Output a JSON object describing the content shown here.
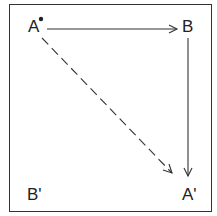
{
  "diagram": {
    "nodes": {
      "a": {
        "label": "A",
        "marker": "dot"
      },
      "b": {
        "label": "B"
      },
      "b_prime": {
        "label": "B'"
      },
      "a_prime": {
        "label": "A'"
      }
    },
    "edges": [
      {
        "from": "A",
        "to": "B",
        "style": "solid"
      },
      {
        "from": "B",
        "to": "A'",
        "style": "solid"
      },
      {
        "from": "A",
        "to": "A'",
        "style": "dashed"
      }
    ],
    "colors": {
      "line": "#333333",
      "text": "#222222",
      "background": "#ffffff"
    }
  }
}
